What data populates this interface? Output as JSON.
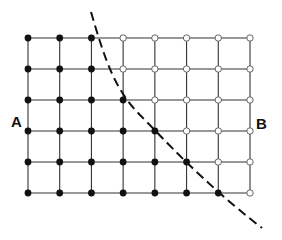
{
  "diagram": {
    "type": "lattice-with-boundary",
    "rows": 6,
    "cols": 8,
    "labels": {
      "left": "A",
      "right": "B"
    },
    "node_states": [
      [
        "filled",
        "filled",
        "filled",
        "open",
        "open",
        "open",
        "open",
        "open"
      ],
      [
        "filled",
        "filled",
        "filled",
        "open",
        "open",
        "open",
        "open",
        "open"
      ],
      [
        "filled",
        "filled",
        "filled",
        "filled",
        "open",
        "open",
        "open",
        "open"
      ],
      [
        "filled",
        "filled",
        "filled",
        "filled",
        "filled",
        "open",
        "open",
        "open"
      ],
      [
        "filled",
        "filled",
        "filled",
        "filled",
        "filled",
        "filled",
        "open",
        "open"
      ],
      [
        "filled",
        "filled",
        "filled",
        "filled",
        "filled",
        "filled",
        "filled",
        "open"
      ]
    ],
    "legend": {
      "filled": "filled node (region A side)",
      "open": "open node (region B side)"
    },
    "boundary": {
      "style": "dashed",
      "description": "curved dashed boundary separating filled and open nodes"
    },
    "colors": {
      "line": "#333333",
      "filled": "#111111",
      "open_stroke": "#555555",
      "boundary": "#111111"
    }
  }
}
